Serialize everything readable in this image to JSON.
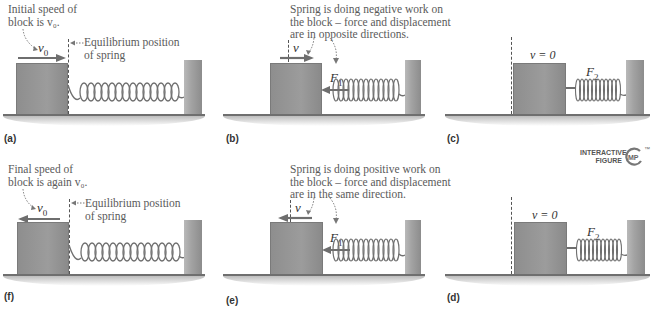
{
  "figure": {
    "colors": {
      "block": "#959595",
      "wall": "#a8a8a8",
      "floor": "#6f6f6f",
      "text": "#5a5a5a",
      "arrow": "#6e6e6e",
      "spring": "#707070"
    },
    "panels": [
      {
        "id": "a",
        "label": "(a)",
        "note_lines": [
          "Initial speed of",
          "block is v₀."
        ],
        "velocity_symbol": "v",
        "velocity_sub": "0",
        "velocity_direction": "right",
        "equilibrium_note_lines": [
          "Equilibrium position",
          "of spring"
        ],
        "spring_state": "relaxed"
      },
      {
        "id": "b",
        "label": "(b)",
        "note_lines": [
          "Spring is doing negative work on",
          "the block – force and displacement",
          "are in opposite directions."
        ],
        "velocity_symbol": "v",
        "velocity_sub": "",
        "velocity_direction": "right",
        "force_symbol": "F",
        "force_sub": "1",
        "spring_state": "compressed"
      },
      {
        "id": "c",
        "label": "(c)",
        "velocity_text": "v = 0",
        "force_symbol": "F",
        "force_sub": "2",
        "spring_state": "max-compressed"
      },
      {
        "id": "d",
        "label": "(d)",
        "velocity_text": "v = 0",
        "force_symbol": "F",
        "force_sub": "2",
        "spring_state": "max-compressed"
      },
      {
        "id": "e",
        "label": "(e)",
        "note_lines": [
          "Spring is doing positive work on",
          "the block – force and displacement",
          "are in the same direction."
        ],
        "velocity_symbol": "v",
        "velocity_sub": "",
        "velocity_direction": "left",
        "force_symbol": "F",
        "force_sub": "1",
        "spring_state": "compressed"
      },
      {
        "id": "f",
        "label": "(f)",
        "note_lines": [
          "Final speed of",
          "block is again v₀."
        ],
        "velocity_symbol": "v",
        "velocity_sub": "0",
        "velocity_direction": "left",
        "equilibrium_note_lines": [
          "Equilibrium position",
          "of spring"
        ],
        "spring_state": "relaxed"
      }
    ],
    "badge": {
      "line1": "INTERACTIVE",
      "line2": "FIGURE",
      "mark": "MP",
      "tm": "™"
    }
  }
}
